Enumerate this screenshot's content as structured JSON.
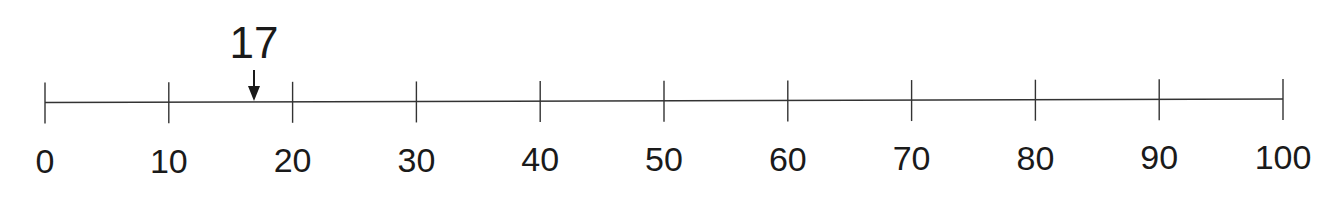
{
  "number_line": {
    "min": 0,
    "max": 100,
    "step": 10,
    "ticks": [
      {
        "value": 0,
        "label": "0"
      },
      {
        "value": 10,
        "label": "10"
      },
      {
        "value": 20,
        "label": "20"
      },
      {
        "value": 30,
        "label": "30"
      },
      {
        "value": 40,
        "label": "40"
      },
      {
        "value": 50,
        "label": "50"
      },
      {
        "value": 60,
        "label": "60"
      },
      {
        "value": 70,
        "label": "70"
      },
      {
        "value": 80,
        "label": "80"
      },
      {
        "value": 90,
        "label": "90"
      },
      {
        "value": 100,
        "label": "100"
      }
    ],
    "marker": {
      "value": 17,
      "label": "17",
      "icon": "down-arrow-icon"
    },
    "colors": {
      "line": "#333333",
      "text": "#1a1a1a"
    }
  }
}
